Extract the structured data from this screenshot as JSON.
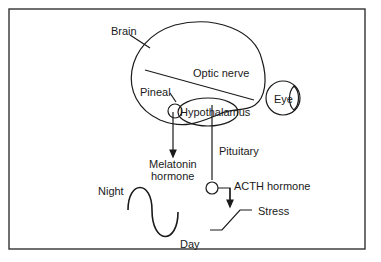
{
  "diagram": {
    "labels": {
      "brain": "Brain",
      "optic_nerve": "Optic nerve",
      "pineal": "Pineal",
      "hypothalamus": "Hypothalamus",
      "eye": "Eye",
      "melatonin_line1": "Melatonin",
      "melatonin_line2": "hormone",
      "pituitary": "Pituitary",
      "acth": "ACTH hormone",
      "night": "Night",
      "day": "Day",
      "stress": "Stress"
    },
    "colors": {
      "stroke": "#1a1a1a",
      "background": "#ffffff"
    }
  }
}
